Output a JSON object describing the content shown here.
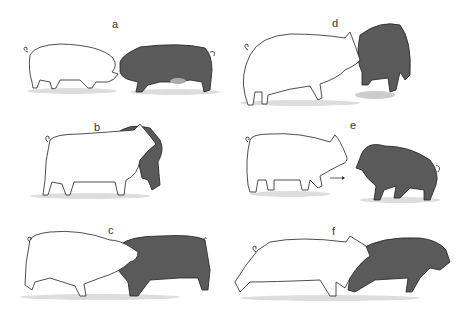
{
  "figure": {
    "panels": [
      {
        "id": "a",
        "label": "a",
        "description": "white pig and dark pig face to face, snout to snout"
      },
      {
        "id": "b",
        "label": "b",
        "description": "white pig overlapping dark pig rearing behind, mouths open"
      },
      {
        "id": "c",
        "label": "c",
        "description": "white pig pushing head into shoulder of dark pig, parallel"
      },
      {
        "id": "d",
        "label": "d",
        "description": "white pig nosing dark pig which is turned toward viewer"
      },
      {
        "id": "e",
        "label": "e",
        "description": "white pig approaching dark pig facing it, arrow indicating movement"
      },
      {
        "id": "f",
        "label": "f",
        "description": "white pig chasing/biting dark pig running away"
      }
    ],
    "colors": {
      "white_pig": "#ffffff",
      "dark_pig": "#5a5a5a",
      "outline": "#222222",
      "shadow": "#d8d8d8"
    }
  }
}
